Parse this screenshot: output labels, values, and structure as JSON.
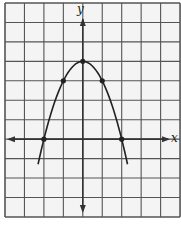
{
  "chart_data": {
    "type": "line",
    "title": "",
    "xlabel": "x",
    "ylabel": "y",
    "equation": "y = -x^2 + 4",
    "xlim": [
      -4,
      5
    ],
    "ylim": [
      -4,
      7
    ],
    "grid": true,
    "grid_step": 1,
    "tick_labels": false,
    "series": [
      {
        "name": "parabola",
        "points": [
          [
            -2.3,
            -1.3
          ],
          [
            -2,
            0
          ],
          [
            -1,
            3
          ],
          [
            0,
            4
          ],
          [
            1,
            3
          ],
          [
            2,
            0
          ],
          [
            2.3,
            -1.3
          ]
        ],
        "marked_points": [
          [
            -2,
            0
          ],
          [
            -1,
            3
          ],
          [
            0,
            4
          ],
          [
            1,
            3
          ],
          [
            2,
            0
          ]
        ]
      }
    ]
  },
  "axes": {
    "x_label": "x",
    "y_label": "y"
  },
  "colors": {
    "grid": "#555555",
    "axis": "#333333",
    "curve": "#222222",
    "background": "#f4f4f4"
  }
}
